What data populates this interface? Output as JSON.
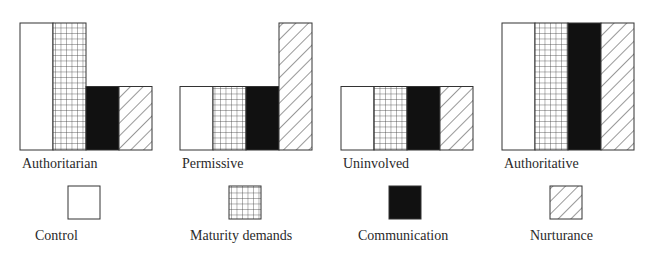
{
  "chart_data": {
    "type": "bar",
    "title": "",
    "xlabel": "",
    "ylabel": "",
    "ylim": [
      0,
      2
    ],
    "level_scale": {
      "low": 1,
      "high": 2
    },
    "categories": [
      "Authoritarian",
      "Permissive",
      "Uninvolved",
      "Authoritative"
    ],
    "series": [
      {
        "name": "Control",
        "pattern": "empty",
        "values": [
          2,
          1,
          1,
          2
        ]
      },
      {
        "name": "Maturity demands",
        "pattern": "grid",
        "values": [
          2,
          1,
          1,
          2
        ]
      },
      {
        "name": "Communication",
        "pattern": "solid",
        "values": [
          1,
          1,
          1,
          2
        ]
      },
      {
        "name": "Nurturance",
        "pattern": "diagonal",
        "values": [
          1,
          2,
          1,
          2
        ]
      }
    ],
    "legend": {
      "placement": "bottom",
      "entries": [
        "Control",
        "Maturity demands",
        "Communication",
        "Nurturance"
      ]
    },
    "grid": false,
    "colors": {
      "stroke": "#333333",
      "solid": "#111111",
      "background": "#ffffff"
    }
  }
}
